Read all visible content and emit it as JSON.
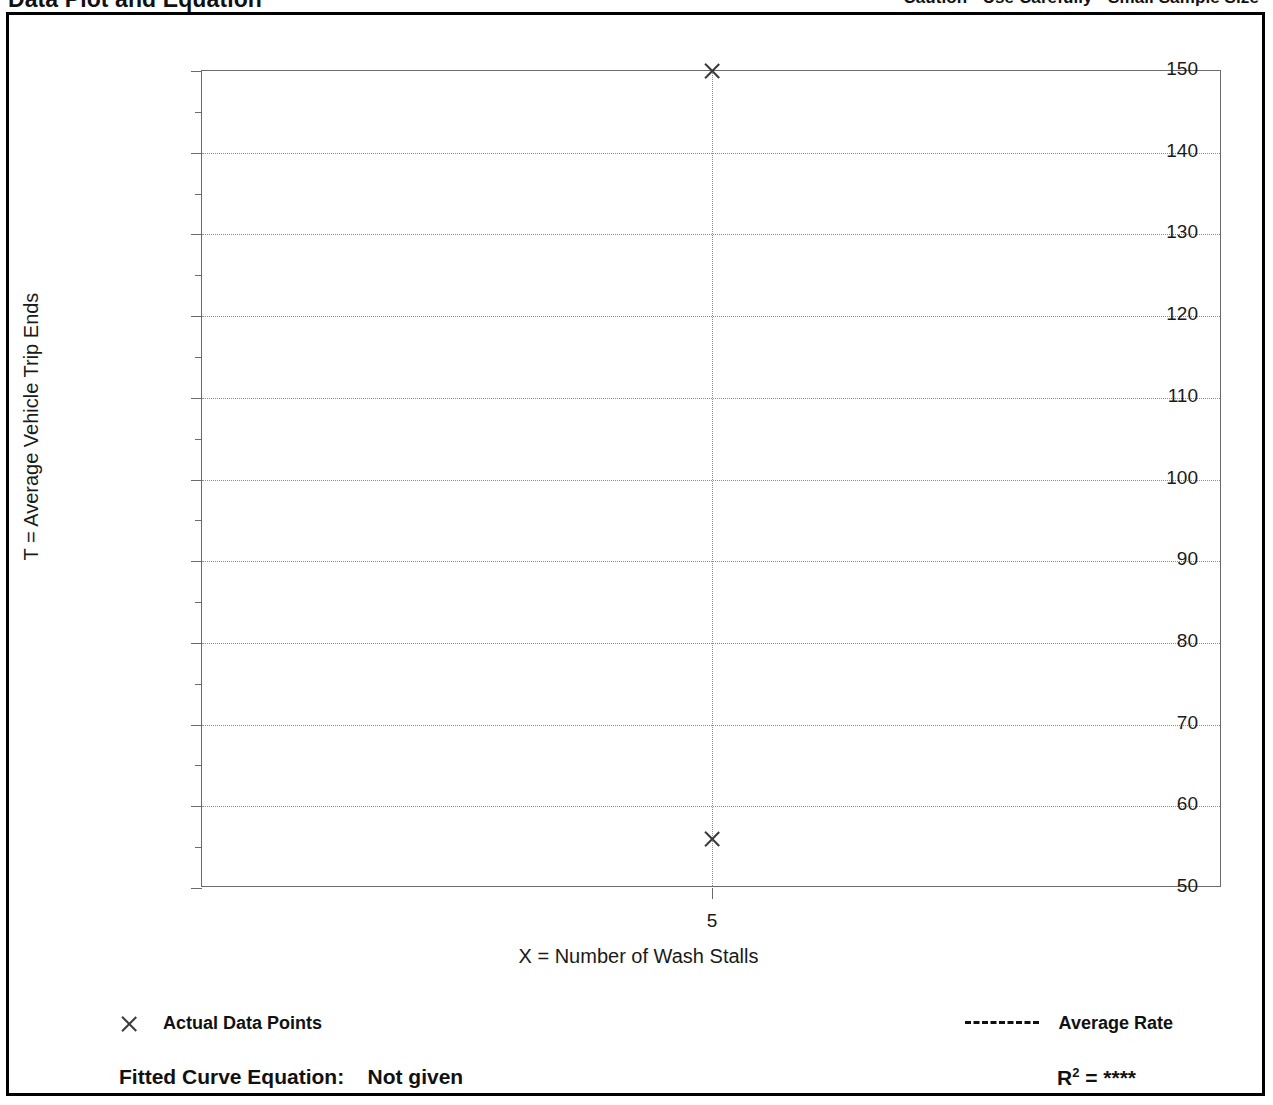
{
  "header": {
    "title": "Data Plot and Equation",
    "caution": "Caution - Use Carefully - Small Sample Size"
  },
  "legend": {
    "data_points_label": "Actual Data Points",
    "average_rate_label": "Average Rate",
    "marker_icon": "x-marker-icon",
    "dash_icon": "dashed-line-icon"
  },
  "footer": {
    "equation_label": "Fitted Curve Equation:",
    "equation_value": "Not given",
    "r2_symbol": "R",
    "r2_exponent": "2",
    "r2_equals": " = ",
    "r2_value": "****"
  },
  "chart_data": {
    "type": "scatter",
    "title": "Data Plot and Equation",
    "xlabel": "X = Number of Wash Stalls",
    "ylabel": "T = Average Vehicle Trip Ends",
    "xlim": [
      4.0,
      6.0
    ],
    "ylim": [
      50,
      150
    ],
    "grid": true,
    "y_ticks": [
      50,
      60,
      70,
      80,
      90,
      100,
      110,
      120,
      130,
      140,
      150
    ],
    "y_tick_labels": [
      "50",
      "60",
      "70",
      "80",
      "90",
      "100",
      "110",
      "120",
      "130",
      "140",
      "150"
    ],
    "y_minor_ticks": [
      55,
      65,
      75,
      85,
      95,
      105,
      115,
      125,
      135,
      145
    ],
    "x_ticks": [
      5
    ],
    "x_tick_labels": [
      "5"
    ],
    "points": [
      {
        "x": 5,
        "y": 150
      },
      {
        "x": 5,
        "y": 56
      }
    ],
    "average_rate_line": {
      "x": 5,
      "style": "dotted",
      "label": "Average Rate"
    },
    "legend": [
      "Actual Data Points",
      "Average Rate"
    ],
    "legend_position": "below-axis",
    "annotations": [
      "Fitted Curve Equation: Not given",
      "R2 = ****",
      "Caution - Use Carefully - Small Sample Size"
    ]
  }
}
